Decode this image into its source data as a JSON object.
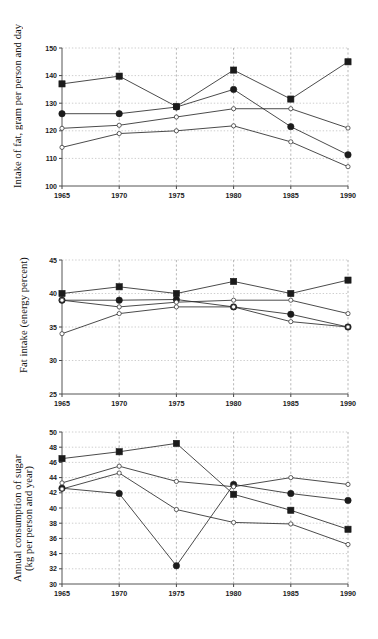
{
  "figure": {
    "background": "#ffffff",
    "marker_fill_color": "#1b1b1b",
    "marker_open_color": "#ffffff",
    "line_color": "#2a2a2a",
    "grid_color": "#b9b9b9"
  },
  "chart_data": [
    {
      "type": "line",
      "title": "",
      "xlabel": "",
      "ylabel": "Intake of fat, gram per person and day",
      "x": [
        1965,
        1970,
        1975,
        1980,
        1985,
        1990
      ],
      "xticklabels": [
        "1965",
        "1970",
        "1975",
        "1980",
        "1985",
        "1990"
      ],
      "yticklabels": [
        "100",
        "110",
        "120",
        "130",
        "140",
        "150"
      ],
      "yticks": [
        100,
        110,
        120,
        130,
        140,
        150
      ],
      "ylim": [
        100,
        150
      ],
      "xlim": [
        1965,
        1990
      ],
      "grid": true,
      "legend": "none",
      "series": [
        {
          "name": "series-filled-square",
          "marker": "filled-square",
          "values": [
            137.0,
            139.8,
            128.8,
            142.0,
            131.5,
            145.0
          ]
        },
        {
          "name": "series-filled-circle",
          "marker": "filled-circle",
          "values": [
            126.2,
            126.2,
            128.6,
            135.0,
            121.5,
            111.3
          ]
        },
        {
          "name": "series-open-circle-a",
          "marker": "open-circle",
          "values": [
            120.9,
            122.0,
            125.0,
            128.0,
            128.0,
            121.0
          ]
        },
        {
          "name": "series-open-circle-b",
          "marker": "open-circle",
          "values": [
            114.0,
            119.0,
            120.0,
            121.8,
            116.0,
            107.0
          ]
        }
      ]
    },
    {
      "type": "line",
      "title": "",
      "xlabel": "",
      "ylabel": "Fat intake (energy percent)",
      "x": [
        1965,
        1970,
        1975,
        1980,
        1985,
        1990
      ],
      "xticklabels": [
        "1965",
        "1970",
        "1975",
        "1980",
        "1985",
        "1990"
      ],
      "yticklabels": [
        "25",
        "30",
        "35",
        "40",
        "45"
      ],
      "yticks": [
        25,
        30,
        35,
        40,
        45
      ],
      "ylim": [
        25,
        45
      ],
      "xlim": [
        1965,
        1990
      ],
      "grid": true,
      "legend": "none",
      "series": [
        {
          "name": "series-filled-square",
          "marker": "filled-square",
          "values": [
            40.0,
            41.0,
            40.0,
            41.8,
            40.0,
            42.0
          ]
        },
        {
          "name": "series-filled-circle",
          "marker": "filled-circle",
          "values": [
            39.0,
            39.0,
            39.1,
            38.0,
            36.9,
            35.0
          ]
        },
        {
          "name": "series-open-circle-a",
          "marker": "open-circle",
          "values": [
            39.0,
            38.0,
            38.7,
            39.0,
            39.0,
            37.0
          ]
        },
        {
          "name": "series-open-circle-b",
          "marker": "open-circle",
          "values": [
            34.0,
            37.0,
            38.0,
            38.0,
            35.8,
            35.0
          ]
        }
      ]
    },
    {
      "type": "line",
      "title": "",
      "xlabel": "",
      "ylabel": "Annual consumption of sugar\n(kg per person and year)",
      "x": [
        1965,
        1970,
        1975,
        1980,
        1985,
        1990
      ],
      "xticklabels": [
        "1965",
        "1970",
        "1975",
        "1980",
        "1985",
        "1990"
      ],
      "yticklabels": [
        "30",
        "32",
        "34",
        "36",
        "38",
        "40",
        "42",
        "44",
        "46",
        "48",
        "50"
      ],
      "yticks": [
        30,
        32,
        34,
        36,
        38,
        40,
        42,
        44,
        46,
        48,
        50
      ],
      "ylim": [
        30,
        50
      ],
      "xlim": [
        1965,
        1990
      ],
      "grid": true,
      "legend": "none",
      "series": [
        {
          "name": "series-filled-square",
          "marker": "filled-square",
          "values": [
            46.5,
            47.4,
            48.5,
            41.8,
            39.7,
            37.2
          ]
        },
        {
          "name": "series-filled-circle",
          "marker": "filled-circle",
          "values": [
            42.6,
            41.9,
            32.4,
            43.1,
            41.9,
            41.0
          ]
        },
        {
          "name": "series-open-circle-a",
          "marker": "open-circle",
          "values": [
            43.3,
            45.5,
            43.5,
            42.8,
            44.0,
            43.1
          ]
        },
        {
          "name": "series-open-circle-b",
          "marker": "open-circle",
          "values": [
            42.5,
            44.6,
            39.8,
            38.1,
            37.9,
            35.2
          ]
        }
      ]
    }
  ]
}
